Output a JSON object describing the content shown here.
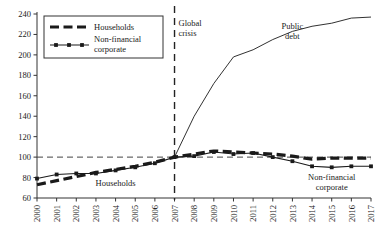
{
  "chart_data": {
    "type": "line",
    "title": "",
    "subtitle": "",
    "xlabel": "",
    "ylabel": "",
    "x": [
      2000,
      2001,
      2002,
      2003,
      2004,
      2005,
      2006,
      2007,
      2008,
      2009,
      2010,
      2011,
      2012,
      2013,
      2014,
      2015,
      2016,
      2017
    ],
    "xlim": [
      2000,
      2017
    ],
    "ylim": [
      60,
      240
    ],
    "yticks": [
      60,
      80,
      100,
      120,
      140,
      160,
      180,
      200,
      220,
      240
    ],
    "xticks": [
      "2000",
      "2001",
      "2002",
      "2003",
      "2004",
      "2005",
      "2006",
      "2007",
      "2008",
      "2009",
      "2010",
      "2011",
      "2012",
      "2013",
      "2014",
      "2015",
      "2016",
      "2017"
    ],
    "grid": false,
    "reference_lines": {
      "horizontal": {
        "value": 100,
        "style": "dashed",
        "label": ""
      },
      "vertical": {
        "value": 2007,
        "style": "dashed",
        "label": "Global crisis"
      }
    },
    "legend_position": "top-left",
    "series": [
      {
        "name": "Public debt",
        "style": "thin-solid",
        "values": [
          null,
          null,
          null,
          null,
          null,
          null,
          null,
          100,
          140,
          172,
          198,
          205,
          215,
          223,
          228,
          231,
          236,
          237
        ]
      },
      {
        "name": "Households",
        "style": "thick-dashed",
        "values": [
          73,
          77,
          81,
          85,
          88,
          91,
          95,
          100,
          103,
          106,
          105,
          104,
          103,
          101,
          98,
          99,
          99,
          99
        ]
      },
      {
        "name": "Non-financial corporate",
        "style": "thin-marker",
        "values": [
          79,
          83,
          84,
          84,
          87,
          90,
          94,
          100,
          101,
          105,
          103,
          104,
          100,
          96,
          91,
          90,
          91,
          91
        ]
      }
    ],
    "annotations": [
      {
        "text": "Global crisis",
        "x": 2007,
        "y": 228,
        "name": "global-crisis-label"
      },
      {
        "text": "Public debt",
        "x": 2013,
        "y": 225,
        "name": "public-debt-label"
      },
      {
        "text": "Households",
        "x": 2004,
        "y": 72,
        "name": "households-inline-label"
      },
      {
        "text": "Non-financial corporate",
        "x": 2015,
        "y": 78,
        "name": "non-financial-corporate-inline-label"
      }
    ],
    "legend": [
      {
        "label": "Households",
        "style": "thick-dashed"
      },
      {
        "label": "Non-financial corporate",
        "style": "thin-marker"
      }
    ]
  },
  "colors": {
    "line": "#1a1a1a",
    "axis": "#333333",
    "background": "#ffffff",
    "reference": "#444444"
  }
}
